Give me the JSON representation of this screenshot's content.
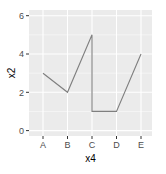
{
  "chart_data": {
    "type": "line",
    "title": "",
    "xlabel": "x4",
    "ylabel": "x2",
    "categories": [
      "A",
      "B",
      "C",
      "D",
      "E"
    ],
    "points": [
      {
        "x": "A",
        "y": 3
      },
      {
        "x": "B",
        "y": 2
      },
      {
        "x": "C",
        "y": 5
      },
      {
        "x": "C",
        "y": 1
      },
      {
        "x": "D",
        "y": 1
      },
      {
        "x": "E",
        "y": 4
      }
    ],
    "series": [
      {
        "name": "x2",
        "x": [
          "A",
          "B",
          "C",
          "C",
          "D",
          "E"
        ],
        "values": [
          3,
          2,
          5,
          1,
          1,
          4
        ]
      }
    ],
    "ylim": [
      -0.2,
      6.2
    ],
    "yticks": [
      0,
      2,
      4,
      6
    ],
    "ytick_labels": [
      "0",
      "2",
      "4",
      "6"
    ],
    "xtick_labels": [
      "A",
      "B",
      "C",
      "D",
      "E"
    ],
    "grid": true,
    "legend": null,
    "style": {
      "panel_background": "#ebebeb",
      "grid_color": "#ffffff",
      "line_color": "#7f7f7f"
    }
  }
}
